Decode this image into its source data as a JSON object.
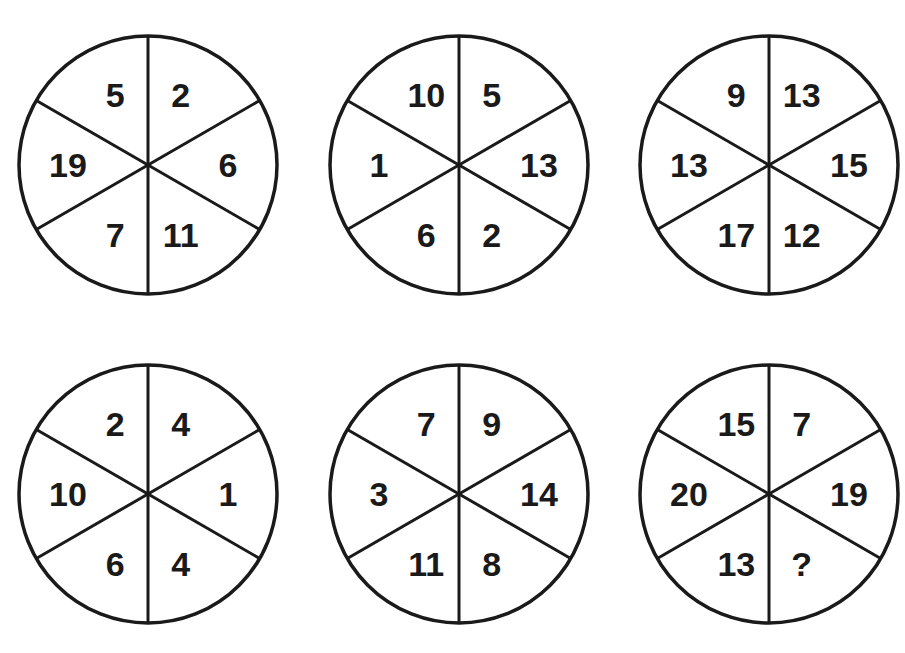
{
  "puzzle": {
    "type": "number-wheel-puzzle",
    "segment_order": [
      "top-left",
      "top-right",
      "right",
      "bottom-right",
      "bottom-left",
      "left"
    ],
    "circles": [
      {
        "id": "circle-1",
        "row": 1,
        "col": 1,
        "cx": 148,
        "cy": 165,
        "values": [
          "5",
          "2",
          "6",
          "11",
          "7",
          "19"
        ]
      },
      {
        "id": "circle-2",
        "row": 1,
        "col": 2,
        "cx": 459,
        "cy": 165,
        "values": [
          "10",
          "5",
          "13",
          "2",
          "6",
          "1"
        ]
      },
      {
        "id": "circle-3",
        "row": 1,
        "col": 3,
        "cx": 769,
        "cy": 165,
        "values": [
          "9",
          "13",
          "15",
          "12",
          "17",
          "13"
        ]
      },
      {
        "id": "circle-4",
        "row": 2,
        "col": 1,
        "cx": 148,
        "cy": 494,
        "values": [
          "2",
          "4",
          "1",
          "4",
          "6",
          "10"
        ]
      },
      {
        "id": "circle-5",
        "row": 2,
        "col": 2,
        "cx": 459,
        "cy": 494,
        "values": [
          "7",
          "9",
          "14",
          "8",
          "11",
          "3"
        ]
      },
      {
        "id": "circle-6",
        "row": 2,
        "col": 3,
        "cx": 769,
        "cy": 494,
        "values": [
          "15",
          "7",
          "19",
          "?",
          "13",
          "20"
        ]
      }
    ],
    "radius": 129,
    "colors": {
      "stroke": "#1a1a1a",
      "fill": "#ffffff",
      "text": "#1a1a1a"
    }
  }
}
